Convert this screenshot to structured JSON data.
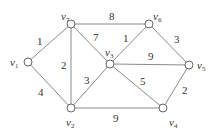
{
  "graph": {
    "nodes": [
      {
        "id": "v1",
        "name": "v",
        "sub": "1",
        "x": 28,
        "y": 62,
        "lx": 10,
        "ly": 66
      },
      {
        "id": "v2",
        "name": "v",
        "sub": "2",
        "x": 71,
        "y": 108,
        "lx": 66,
        "ly": 126
      },
      {
        "id": "v3",
        "name": "v",
        "sub": "3",
        "x": 110,
        "y": 64,
        "lx": 105,
        "ly": 56
      },
      {
        "id": "v4",
        "name": "v",
        "sub": "4",
        "x": 163,
        "y": 108,
        "lx": 169,
        "ly": 126
      },
      {
        "id": "v5",
        "name": "v",
        "sub": "5",
        "x": 189,
        "y": 65,
        "lx": 197,
        "ly": 69
      },
      {
        "id": "v6",
        "name": "v",
        "sub": "6",
        "x": 149,
        "y": 24,
        "lx": 153,
        "ly": 20
      },
      {
        "id": "v7",
        "name": "v",
        "sub": "7",
        "x": 71,
        "y": 24,
        "lx": 61,
        "ly": 20
      }
    ],
    "edges": [
      {
        "from": "v1",
        "to": "v7",
        "weight": "1",
        "lx": 37,
        "ly": 45
      },
      {
        "from": "v1",
        "to": "v2",
        "weight": "4",
        "lx": 38,
        "ly": 96
      },
      {
        "from": "v7",
        "to": "v2",
        "weight": "2",
        "lx": 61,
        "ly": 69
      },
      {
        "from": "v7",
        "to": "v6",
        "weight": "8",
        "lx": 109,
        "ly": 20
      },
      {
        "from": "v7",
        "to": "v3",
        "weight": "7",
        "lx": 93,
        "ly": 41
      },
      {
        "from": "v2",
        "to": "v3",
        "weight": "3",
        "lx": 84,
        "ly": 84
      },
      {
        "from": "v2",
        "to": "v4",
        "weight": "9",
        "lx": 113,
        "ly": 122
      },
      {
        "from": "v3",
        "to": "v6",
        "weight": "1",
        "lx": 123,
        "ly": 42
      },
      {
        "from": "v3",
        "to": "v5",
        "weight": "9",
        "lx": 148,
        "ly": 60
      },
      {
        "from": "v3",
        "to": "v4",
        "weight": "5",
        "lx": 140,
        "ly": 85
      },
      {
        "from": "v6",
        "to": "v5",
        "weight": "3",
        "lx": 174,
        "ly": 43
      },
      {
        "from": "v5",
        "to": "v4",
        "weight": "2",
        "lx": 182,
        "ly": 94
      }
    ]
  }
}
